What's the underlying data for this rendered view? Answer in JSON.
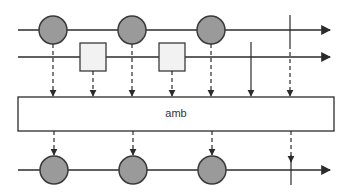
{
  "diagram": {
    "type": "marble-diagram",
    "operator": {
      "label": "amb",
      "box": {
        "x": 18,
        "y": 97,
        "w": 316,
        "h": 34
      }
    },
    "colors": {
      "line": "#2b2b2b",
      "marble_fill": "#9a9a9a",
      "marble_stroke": "#3a3a3a",
      "square_fill": "#f2f2f2",
      "box_fill": "#ffffff"
    },
    "inputs": [
      {
        "name": "input-stream-1",
        "y": 30,
        "x_start": 18,
        "x_end": 330,
        "items": [
          {
            "shape": "circle",
            "x": 53
          },
          {
            "shape": "circle",
            "x": 132
          },
          {
            "shape": "circle",
            "x": 211
          }
        ],
        "completion_x": 290
      },
      {
        "name": "input-stream-2",
        "y": 57,
        "x_start": 18,
        "x_end": 330,
        "items": [
          {
            "shape": "square",
            "x": 93
          },
          {
            "shape": "square",
            "x": 172
          }
        ],
        "completion_x": 251
      }
    ],
    "output": {
      "name": "output-stream",
      "y": 170,
      "x_start": 18,
      "x_end": 330,
      "items": [
        {
          "shape": "circle",
          "x": 54
        },
        {
          "shape": "circle",
          "x": 133
        },
        {
          "shape": "circle",
          "x": 212
        }
      ],
      "completion_x": 291
    }
  }
}
